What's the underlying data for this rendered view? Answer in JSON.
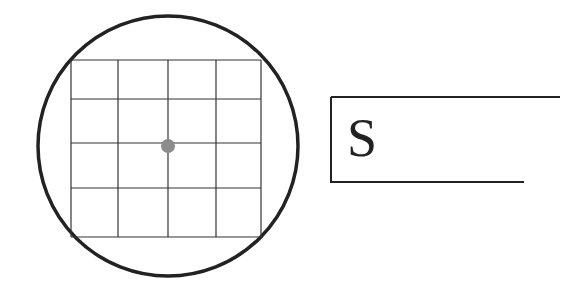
{
  "diagram": {
    "grid": {
      "rows": 4,
      "cols": 4
    },
    "center_dot_color": "#8c8c8c",
    "stroke_color": "#222222",
    "label": "S"
  }
}
